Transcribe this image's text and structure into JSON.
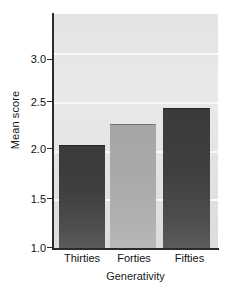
{
  "chart_data": {
    "type": "bar",
    "title": "",
    "xlabel": "Generativity",
    "ylabel": "Mean score",
    "categories": [
      "Thirties",
      "Forties",
      "Fifties"
    ],
    "values": [
      2.06,
      2.27,
      2.44
    ],
    "ylim": [
      1.0,
      3.4
    ],
    "ytick_labels": [
      "1.0",
      "1.5",
      "2.0",
      "2.5",
      "3.0"
    ],
    "ytick_values": [
      1.0,
      1.5,
      2.0,
      2.5,
      3.0
    ],
    "grid": "horizontal-white",
    "legend": "none",
    "bar_colors": [
      "#3f3f3f",
      "#a9a9a9",
      "#3f3f3f"
    ],
    "plot_background": "#e6e6e6",
    "axis_color": "#2b2b2b"
  }
}
